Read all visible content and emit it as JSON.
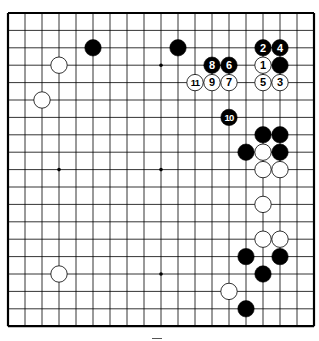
{
  "diagram": {
    "type": "go-board",
    "size": 19,
    "colors": {
      "background": "#ffffff",
      "line": "#000000",
      "black_stone": "#000000",
      "white_stone": "#ffffff",
      "label_on_black": "#ffffff",
      "label_on_white": "#000000"
    },
    "star_points": [
      [
        3,
        3
      ],
      [
        9,
        3
      ],
      [
        15,
        3
      ],
      [
        3,
        9
      ],
      [
        9,
        9
      ],
      [
        15,
        9
      ],
      [
        3,
        15
      ],
      [
        9,
        15
      ],
      [
        15,
        15
      ]
    ],
    "stones": [
      {
        "color": "black",
        "col": 5,
        "row": 2,
        "label": ""
      },
      {
        "color": "black",
        "col": 10,
        "row": 2,
        "label": ""
      },
      {
        "color": "white",
        "col": 3,
        "row": 3,
        "label": ""
      },
      {
        "color": "white",
        "col": 2,
        "row": 5,
        "label": ""
      },
      {
        "color": "black",
        "col": 16,
        "row": 3,
        "label": ""
      },
      {
        "color": "white",
        "col": 15,
        "row": 3,
        "label": "1"
      },
      {
        "color": "black",
        "col": 15,
        "row": 2,
        "label": "2"
      },
      {
        "color": "white",
        "col": 16,
        "row": 4,
        "label": "3"
      },
      {
        "color": "black",
        "col": 16,
        "row": 2,
        "label": "4"
      },
      {
        "color": "white",
        "col": 15,
        "row": 4,
        "label": "5"
      },
      {
        "color": "black",
        "col": 13,
        "row": 3,
        "label": "6"
      },
      {
        "color": "white",
        "col": 13,
        "row": 4,
        "label": "7"
      },
      {
        "color": "black",
        "col": 12,
        "row": 3,
        "label": "8"
      },
      {
        "color": "white",
        "col": 12,
        "row": 4,
        "label": "9"
      },
      {
        "color": "black",
        "col": 13,
        "row": 6,
        "label": "10"
      },
      {
        "color": "white",
        "col": 11,
        "row": 4,
        "label": "11"
      },
      {
        "color": "black",
        "col": 15,
        "row": 7,
        "label": ""
      },
      {
        "color": "black",
        "col": 16,
        "row": 7,
        "label": ""
      },
      {
        "color": "black",
        "col": 14,
        "row": 8,
        "label": ""
      },
      {
        "color": "white",
        "col": 15,
        "row": 8,
        "label": ""
      },
      {
        "color": "black",
        "col": 16,
        "row": 8,
        "label": ""
      },
      {
        "color": "white",
        "col": 15,
        "row": 9,
        "label": ""
      },
      {
        "color": "white",
        "col": 16,
        "row": 9,
        "label": ""
      },
      {
        "color": "white",
        "col": 15,
        "row": 11,
        "label": ""
      },
      {
        "color": "white",
        "col": 15,
        "row": 13,
        "label": ""
      },
      {
        "color": "white",
        "col": 16,
        "row": 13,
        "label": ""
      },
      {
        "color": "black",
        "col": 14,
        "row": 14,
        "label": ""
      },
      {
        "color": "black",
        "col": 16,
        "row": 14,
        "label": ""
      },
      {
        "color": "black",
        "col": 15,
        "row": 15,
        "label": ""
      },
      {
        "color": "white",
        "col": 3,
        "row": 15,
        "label": ""
      },
      {
        "color": "white",
        "col": 13,
        "row": 16,
        "label": ""
      },
      {
        "color": "black",
        "col": 14,
        "row": 17,
        "label": ""
      }
    ]
  }
}
